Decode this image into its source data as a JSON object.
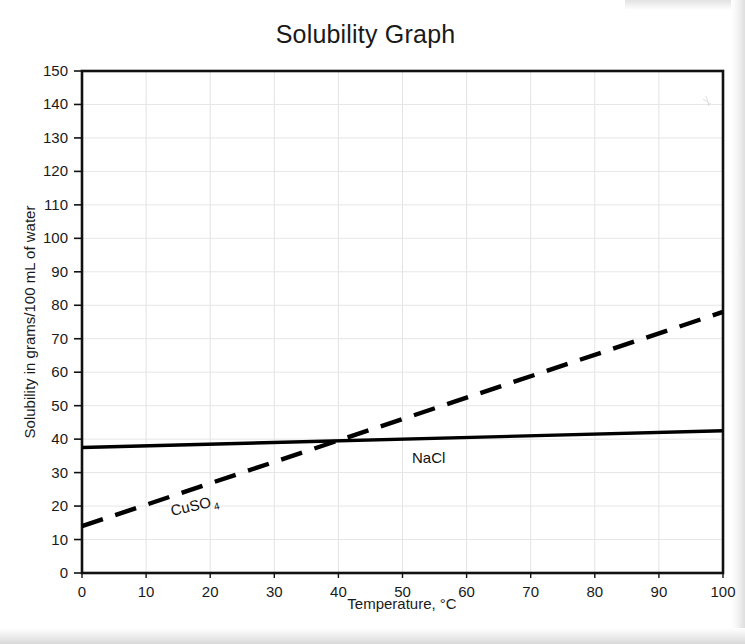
{
  "chart_data": {
    "type": "line",
    "title": "Solubility Graph",
    "xlabel": "Temperature, °C",
    "ylabel": "Solubility in grams/100 mL of water",
    "xlim": [
      0,
      100
    ],
    "ylim": [
      0,
      150
    ],
    "xticks": [
      "0",
      "10",
      "20",
      "30",
      "40",
      "50",
      "60",
      "70",
      "80",
      "90",
      "100"
    ],
    "yticks": [
      "0",
      "10",
      "20",
      "30",
      "40",
      "50",
      "60",
      "70",
      "80",
      "90",
      "100",
      "110",
      "120",
      "130",
      "140",
      "150"
    ],
    "grid": true,
    "legend": "inline-labels",
    "series": [
      {
        "name": "NaCl",
        "label_main": "NaCl",
        "label_sub": "",
        "style": "solid",
        "color": "#000000",
        "x": [
          0,
          100
        ],
        "values": [
          37.5,
          42.5
        ]
      },
      {
        "name": "CuSO4",
        "label_main": "CuSO",
        "label_sub": "4",
        "style": "dashed",
        "color": "#000000",
        "x": [
          0,
          100
        ],
        "values": [
          14,
          78
        ]
      }
    ]
  }
}
